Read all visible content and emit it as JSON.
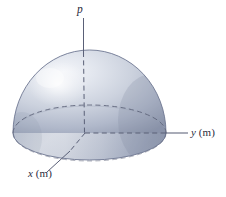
{
  "figure": {
    "type": "3d-hemisphere-diagram",
    "background_color": "#ffffff",
    "caption": "",
    "labels": {
      "vertical_axis": "p",
      "right_axis_var": "y",
      "right_axis_unit": "(m)",
      "left_axis_var": "x",
      "left_axis_unit": "(m)"
    },
    "colors": {
      "body_light": "#e6e9ef",
      "body_mid": "#c3c9d7",
      "body_dark": "#8e97ad",
      "outline": "#6e7792",
      "axis_line": "#5a6077",
      "dashed_line": "#5a6077",
      "text": "#2b2b3c",
      "highlight": "#f2f4f8"
    },
    "geometry": {
      "origin_x": 85,
      "origin_y": 133,
      "dome_left": 13,
      "dome_right": 166,
      "dome_apex_y": 50,
      "base_bottom_y": 160,
      "equator_top_y": 105,
      "p_axis_top_y": 18,
      "y_axis_end_x": 188,
      "x_leader_end_x": 47,
      "x_leader_end_y": 172
    }
  }
}
